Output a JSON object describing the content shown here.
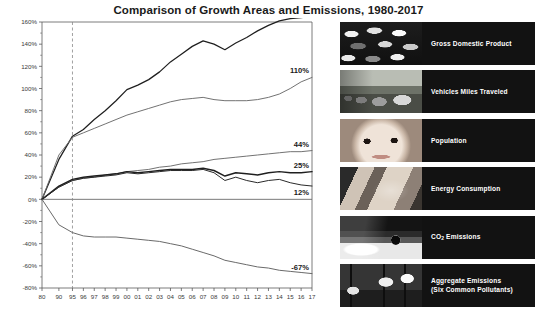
{
  "title": "Comparison of Growth Areas and Emissions, 1980-2017",
  "chart_data": {
    "type": "line",
    "title": "Comparison of Growth Areas and Emissions, 1980-2017",
    "xlabel": "",
    "ylabel": "",
    "ylim": [
      -80,
      160
    ],
    "ytick_labels": [
      "160%",
      "140%",
      "120%",
      "100%",
      "80%",
      "60%",
      "40%",
      "20%",
      "0%",
      "-20%",
      "-40%",
      "-60%",
      "-80%"
    ],
    "ytick_values": [
      160,
      140,
      120,
      100,
      80,
      60,
      40,
      20,
      0,
      -20,
      -40,
      -60,
      -80
    ],
    "grid": false,
    "legend_position": "right",
    "reference_line_x": "95",
    "categories": [
      "80",
      "90",
      "95",
      "96",
      "97",
      "98",
      "99",
      "00",
      "01",
      "02",
      "03",
      "04",
      "05",
      "06",
      "07",
      "08",
      "09",
      "10",
      "11",
      "12",
      "13",
      "14",
      "15",
      "16",
      "17"
    ],
    "series": [
      {
        "name": "Gross Domestic Product",
        "end_label": "165%",
        "values": [
          0,
          36,
          57,
          63,
          72,
          80,
          89,
          99,
          103,
          108,
          115,
          124,
          131,
          138,
          143,
          140,
          135,
          141,
          146,
          152,
          157,
          161,
          163,
          164,
          165
        ]
      },
      {
        "name": "Vehicles Miles Traveled",
        "end_label": "110%",
        "values": [
          0,
          40,
          56,
          60,
          64,
          68,
          72,
          76,
          79,
          82,
          85,
          88,
          90,
          91,
          92,
          90,
          89,
          89,
          89,
          90,
          92,
          95,
          100,
          106,
          110
        ]
      },
      {
        "name": "Population",
        "end_label": "44%",
        "values": [
          0,
          11,
          17,
          19,
          20,
          22,
          23,
          25,
          26,
          27,
          29,
          30,
          32,
          33,
          34,
          36,
          37,
          38,
          39,
          40,
          41,
          42,
          43,
          43,
          44
        ]
      },
      {
        "name": "Energy Consumption",
        "end_label": "25%",
        "values": [
          0,
          12,
          18,
          20,
          21,
          22,
          23,
          25,
          24,
          25,
          26,
          27,
          27,
          27,
          28,
          26,
          21,
          24,
          23,
          22,
          24,
          25,
          24,
          24,
          25
        ]
      },
      {
        "name": "CO2 Emissions",
        "end_label": "12%",
        "values": [
          0,
          11,
          17,
          19,
          20,
          21,
          22,
          24,
          23,
          24,
          25,
          26,
          26,
          26,
          27,
          24,
          17,
          20,
          17,
          15,
          17,
          18,
          15,
          13,
          12
        ]
      },
      {
        "name": "Aggregate Emissions (Six Common Pollutants)",
        "end_label": "-67%",
        "values": [
          0,
          -23,
          -30,
          -33,
          -34,
          -34,
          -34,
          -35,
          -36,
          -37,
          -38,
          -40,
          -42,
          -45,
          -48,
          -51,
          -55,
          -57,
          -59,
          -61,
          -62,
          -64,
          -65,
          -66,
          -67
        ]
      }
    ]
  },
  "legend": {
    "items": [
      {
        "label": "Gross Domestic Product",
        "thumb": "coins-photo",
        "art": "th-coins"
      },
      {
        "label": "Vehicles Miles Traveled",
        "thumb": "traffic-photo",
        "art": "th-cars"
      },
      {
        "label": "Population",
        "thumb": "baby-face-photo",
        "art": "th-baby"
      },
      {
        "label": "Energy Consumption",
        "thumb": "hand-holding-photo",
        "art": "th-hand"
      },
      {
        "label": "CO2 Emissions",
        "thumb": "exhaust-pipe-photo",
        "art": "th-pipe",
        "html": "CO<sub>2</sub> Emissions"
      },
      {
        "label": "Aggregate Emissions (Six Common Pollutants)",
        "thumb": "smokestacks-photo",
        "art": "th-stacks",
        "html": "Aggregate Emissions<br>(Six Common Pollutants)"
      }
    ]
  },
  "colors": {
    "background": "#ffffff",
    "axis": "#5a5a5a",
    "text": "#1a1a1a",
    "legend_panel": "#121212",
    "legend_text": "#ffffff",
    "line_dark": "#1a1a1a",
    "line_mid": "#555555",
    "line_light": "#777777"
  }
}
